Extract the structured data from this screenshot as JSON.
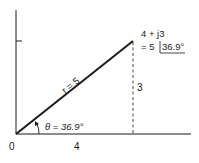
{
  "diagram": {
    "origin_label": "0",
    "x_label": "4",
    "y_label": "3",
    "vector_label": "r = 5",
    "angle_label": "θ = 36.9°",
    "point_rect": "4 + j3",
    "point_polar_prefix": "= 5",
    "point_polar_angle": "36.9°"
  },
  "colors": {
    "ink": "#1a1a1a",
    "background": "#ffffff"
  }
}
